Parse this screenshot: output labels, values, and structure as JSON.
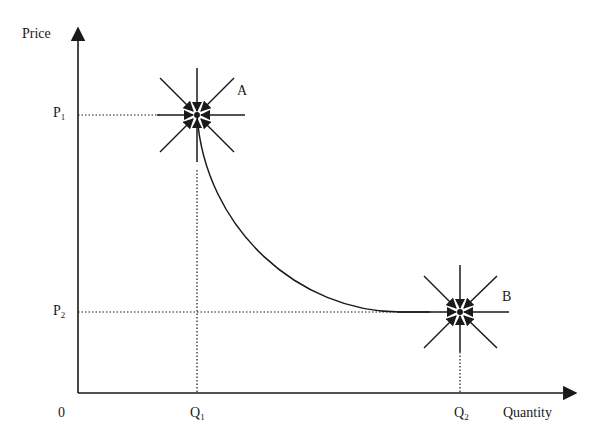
{
  "axes": {
    "y_label": "Price",
    "x_label": "Quantity",
    "origin_label": "0"
  },
  "ticks": {
    "p1": {
      "base": "P",
      "sub": "1"
    },
    "p2": {
      "base": "P",
      "sub": "2"
    },
    "q1": {
      "base": "Q",
      "sub": "1"
    },
    "q2": {
      "base": "Q",
      "sub": "2"
    }
  },
  "points": {
    "a": {
      "label": "A"
    },
    "b": {
      "label": "B"
    }
  },
  "colors": {
    "ink": "#1a1a1a",
    "background": "#ffffff"
  }
}
